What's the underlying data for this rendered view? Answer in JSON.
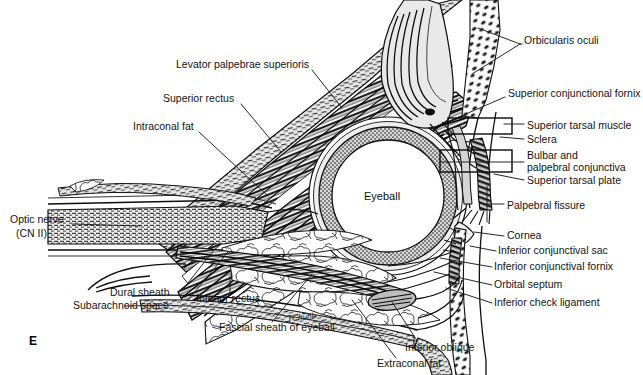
{
  "figure": {
    "panel_letter": "E",
    "artist_signature": "TChubb",
    "center_label": "Eyeball"
  },
  "colors": {
    "ink": "#141414",
    "leader": "#222222",
    "paper": "#ffffff",
    "fat_fill": "#fbfbfb",
    "muscle_dark": "#1b1b1b",
    "sclera_stipple": "#6a6a6a",
    "lid_gray": "#9a9a9a",
    "tissue_gray": "#c9c9c9"
  },
  "labels_left": [
    {
      "id": "levator-palpebrae-superioris",
      "text": "Levator palpebrae superioris",
      "x": 176,
      "y": 64,
      "anchor": "left"
    },
    {
      "id": "superior-rectus",
      "text": "Superior rectus",
      "x": 163,
      "y": 98,
      "anchor": "left"
    },
    {
      "id": "intraconal-fat",
      "text": "Intraconal fat",
      "x": 133,
      "y": 126,
      "anchor": "left"
    },
    {
      "id": "optic-nerve",
      "text": "Optic nerve",
      "x": 10,
      "y": 219,
      "anchor": "left"
    },
    {
      "id": "optic-nerve-cn2",
      "text": "(CN II)",
      "x": 16,
      "y": 233,
      "anchor": "left"
    },
    {
      "id": "dural-sheath",
      "text": "Dural sheath",
      "x": 110,
      "y": 292,
      "anchor": "left"
    },
    {
      "id": "subarachnoid-space",
      "text": "Subarachnoid space",
      "x": 73,
      "y": 305,
      "anchor": "left"
    },
    {
      "id": "inferior-rectus",
      "text": "Inferior rectus",
      "x": 196,
      "y": 298,
      "anchor": "left"
    },
    {
      "id": "fascial-sheath-of-eyeball",
      "text": "Fascial sheath of eyeball",
      "x": 219,
      "y": 327,
      "anchor": "left"
    },
    {
      "id": "extraconal-fat",
      "text": "Extraconal fat",
      "x": 377,
      "y": 363,
      "anchor": "left"
    },
    {
      "id": "inferior-oblique",
      "text": "Inferior oblique",
      "x": 405,
      "y": 347,
      "anchor": "left"
    }
  ],
  "labels_right": [
    {
      "id": "orbicularis-oculi",
      "text": "Orbicularis oculi",
      "x": 524,
      "y": 40,
      "anchor": "left"
    },
    {
      "id": "superior-conjunctional-fornix",
      "text": "Superior conjunctional fornix",
      "x": 508,
      "y": 93,
      "anchor": "left"
    },
    {
      "id": "superior-tarsal-muscle",
      "text": "Superior tarsal muscle",
      "x": 527,
      "y": 125,
      "anchor": "left"
    },
    {
      "id": "sclera",
      "text": "Sclera",
      "x": 527,
      "y": 139,
      "anchor": "left"
    },
    {
      "id": "bulbar-and",
      "text": "Bulbar and",
      "x": 527,
      "y": 155,
      "anchor": "left"
    },
    {
      "id": "palpebral-conjunctiva",
      "text": "palpebral conjunctiva",
      "x": 527,
      "y": 167,
      "anchor": "left"
    },
    {
      "id": "superior-tarsal-plate",
      "text": "Superior tarsal plate",
      "x": 527,
      "y": 180,
      "anchor": "left"
    },
    {
      "id": "palpebral-fissure",
      "text": "Palpebral fissure",
      "x": 507,
      "y": 205,
      "anchor": "left"
    },
    {
      "id": "cornea",
      "text": "Cornea",
      "x": 507,
      "y": 235,
      "anchor": "left"
    },
    {
      "id": "inferior-conjunctival-sac",
      "text": "Inferior conjunctival sac",
      "x": 498,
      "y": 250,
      "anchor": "left"
    },
    {
      "id": "inferior-conjunctival-fornix",
      "text": "Inferior conjunctival fornix",
      "x": 494,
      "y": 266,
      "anchor": "left"
    },
    {
      "id": "orbital-septum",
      "text": "Orbital septum",
      "x": 494,
      "y": 284,
      "anchor": "left"
    },
    {
      "id": "inferior-check-ligament",
      "text": "Inferior check ligament",
      "x": 494,
      "y": 302,
      "anchor": "left"
    }
  ]
}
